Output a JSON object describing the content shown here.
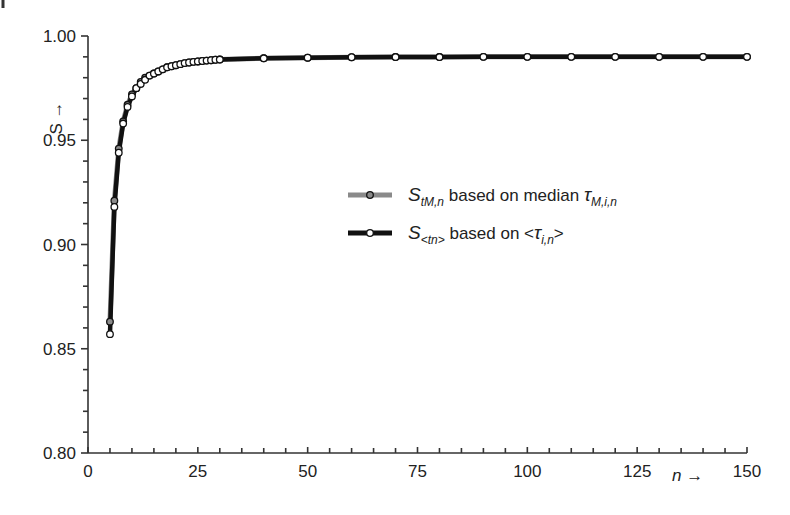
{
  "chart_data": {
    "type": "line",
    "title": "",
    "xlabel": "n →",
    "ylabel": "S →",
    "xlim": [
      0,
      150
    ],
    "ylim": [
      0.8,
      1.0
    ],
    "x_ticks": [
      0,
      25,
      50,
      75,
      100,
      125,
      150
    ],
    "x_tick_labels": [
      "0",
      "25",
      "50",
      "75",
      "100",
      "125",
      "150"
    ],
    "x_minor_step": 5,
    "y_ticks": [
      0.8,
      0.85,
      0.9,
      0.95,
      1.0
    ],
    "y_tick_labels": [
      "0.80",
      "0.85",
      "0.90",
      "0.95",
      "1.00"
    ],
    "y_minor_step": 0.01,
    "grid": false,
    "legend_position": "center-right",
    "series": [
      {
        "name": "S_tM,n based on median τ_M,i,n",
        "legend_main": "S",
        "legend_sub": "tM,n",
        "legend_rest": " based on median ",
        "legend_tau": "τ",
        "legend_tau_sub": "M,i,n",
        "line_color": "#8a8a8a",
        "marker_fill": "#8a8a8a",
        "x": [
          5,
          6,
          7,
          8,
          9,
          10,
          11,
          12,
          13,
          14,
          15,
          16,
          17,
          18,
          19,
          20,
          21,
          22,
          23,
          24,
          25,
          26,
          27,
          28,
          29,
          30,
          40,
          50,
          60,
          70,
          80,
          90,
          100,
          110,
          120,
          130,
          140,
          150
        ],
        "y": [
          0.863,
          0.921,
          0.946,
          0.959,
          0.967,
          0.972,
          0.975,
          0.978,
          0.98,
          0.981,
          0.982,
          0.983,
          0.984,
          0.985,
          0.9855,
          0.986,
          0.9865,
          0.987,
          0.9873,
          0.9876,
          0.9878,
          0.988,
          0.9882,
          0.9884,
          0.9886,
          0.9887,
          0.9893,
          0.9896,
          0.9898,
          0.9899,
          0.9899,
          0.99,
          0.99,
          0.99,
          0.99,
          0.99,
          0.99,
          0.99
        ]
      },
      {
        "name": "S_<tn> based on <τ_i,n>",
        "legend_main": "S",
        "legend_sub": "<tn>",
        "legend_rest": " based on <",
        "legend_tau": "τ",
        "legend_tau_sub": "i,n",
        "legend_end": ">",
        "line_color": "#111111",
        "marker_fill": "#ffffff",
        "x": [
          5,
          6,
          7,
          8,
          9,
          10,
          11,
          12,
          13,
          14,
          15,
          16,
          17,
          18,
          19,
          20,
          21,
          22,
          23,
          24,
          25,
          26,
          27,
          28,
          29,
          30,
          40,
          50,
          60,
          70,
          80,
          90,
          100,
          110,
          120,
          130,
          140,
          150
        ],
        "y": [
          0.857,
          0.918,
          0.944,
          0.958,
          0.966,
          0.971,
          0.975,
          0.977,
          0.979,
          0.981,
          0.982,
          0.983,
          0.984,
          0.985,
          0.9855,
          0.986,
          0.9865,
          0.987,
          0.9873,
          0.9876,
          0.9878,
          0.988,
          0.9882,
          0.9884,
          0.9886,
          0.9887,
          0.9893,
          0.9896,
          0.9898,
          0.9899,
          0.9899,
          0.99,
          0.99,
          0.99,
          0.99,
          0.99,
          0.99,
          0.99
        ]
      }
    ]
  }
}
